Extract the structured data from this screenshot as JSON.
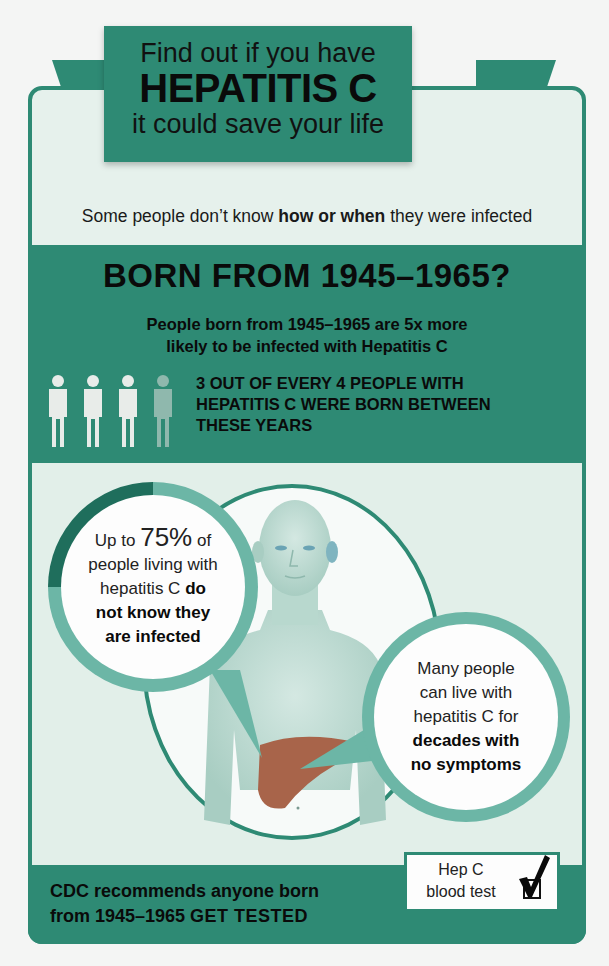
{
  "ribbon": {
    "line1": "Find out if you have",
    "line2": "HEPATITIS C",
    "line3": "it could save your life"
  },
  "subtitle": {
    "prefix": "Some people don’t know ",
    "bold": "how or when",
    "suffix": " they were infected"
  },
  "born_section": {
    "heading": "BORN FROM 1945–1965?",
    "line1_prefix": "People born from 1945–1965 are ",
    "line1_bold": "5x more",
    "line2": "likely to be infected with Hepatitis C",
    "people_icons": [
      {
        "name": "person-icon",
        "state": "highlighted"
      },
      {
        "name": "person-icon",
        "state": "highlighted"
      },
      {
        "name": "person-icon",
        "state": "highlighted"
      },
      {
        "name": "person-icon",
        "state": "faded"
      }
    ],
    "stat_lines": [
      "3 OUT OF EVERY 4 PEOPLE WITH",
      "HEPATITIS C WERE BORN BETWEEN",
      "THESE YEARS"
    ]
  },
  "bubble_left": {
    "prefix": "Up to ",
    "percent": "75%",
    "after_percent": " of",
    "line2": "people living with",
    "line3_regular": "hepatitis C ",
    "line3_bold": "do",
    "line4": "not know they",
    "line5": "are infected",
    "ring_percent": 75
  },
  "bubble_right": {
    "line1": "Many people",
    "line2": "can live with",
    "line3": "hepatitis C for",
    "line4": "decades with",
    "line5": "no symptoms"
  },
  "footer": {
    "line1": "CDC recommends anyone born",
    "line2_regular": "from 1945–1965 ",
    "line2_bold": "GET TESTED"
  },
  "test_box": {
    "line1": "Hep C",
    "line2": "blood test",
    "icon": "checkmark-checkbox-icon"
  },
  "colors": {
    "teal": "#2e8a74",
    "teal_dark": "#1f6e5c",
    "teal_light": "#6cb6a6",
    "panel": "#e6f1ec",
    "liver": "#a8644a"
  }
}
